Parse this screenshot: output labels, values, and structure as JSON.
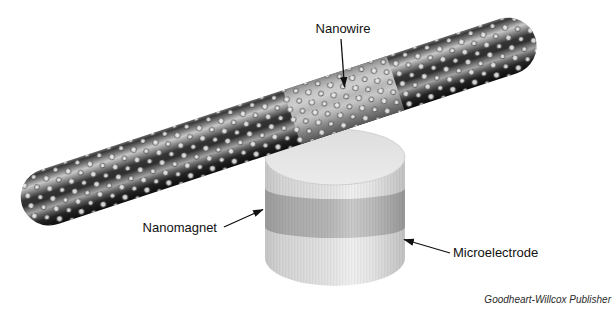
{
  "figure": {
    "labels": {
      "nanowire": "Nanowire",
      "nanomagnet": "Nanomagnet",
      "microelectrode": "Microelectrode"
    },
    "credit": "Goodheart-Willcox Publisher",
    "colors": {
      "background": "#ffffff",
      "wire_dark": "#2b2b2b",
      "wire_highlight": "#c9c9c9",
      "wire_magnet_segment": "#bdbdbd",
      "wire_dot": "#ececec",
      "electrode_body": "#dddddd",
      "electrode_band": "#b2b2b2",
      "label_text": "#111111"
    }
  }
}
